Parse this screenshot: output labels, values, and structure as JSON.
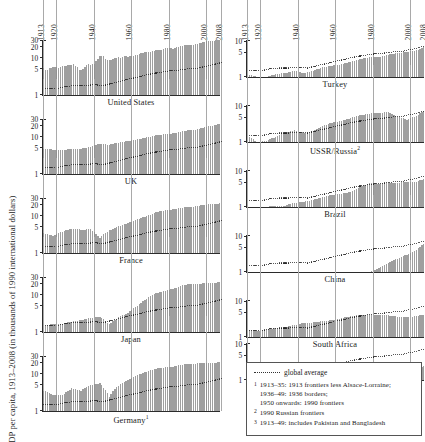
{
  "figure": {
    "ylabel": "GDP per capita, 1913–2008 (in thousands of 1990 international dollars)",
    "year_ticks": [
      "1913",
      "1920",
      "1940",
      "1960",
      "1980",
      "2000",
      "2008"
    ]
  },
  "legend": {
    "global_average_label": "global average",
    "footnotes": [
      {
        "num": "1",
        "lines": [
          "1913–35: 1913 frontiers less Alsace-Lorraine;",
          "1936–49: 1936 borders;",
          "1950 onwards: 1990 frontiers"
        ]
      },
      {
        "num": "2",
        "lines": [
          "1990 Russian frontiers"
        ]
      },
      {
        "num": "3",
        "lines": [
          "1913–49: includes Pakistan and Bangladesh"
        ]
      }
    ]
  },
  "chart_data": {
    "type": "bar",
    "title": "GDP per capita, 1913–2008",
    "ylabel": "GDP per capita, 1913–2008 (in thousands of 1990 international dollars)",
    "xlabel": "",
    "x_start": 1913,
    "x_end": 2008,
    "scale": "log",
    "grid": false,
    "legend_position": "bottom-right",
    "year_ticks": [
      1913,
      1920,
      1940,
      1960,
      1980,
      2000,
      2008
    ],
    "left_column_yticks": [
      1,
      5,
      10,
      20,
      30
    ],
    "right_column_yticks": [
      1,
      5,
      10
    ],
    "left_column_ylim": [
      1,
      33
    ],
    "right_column_ylim": [
      1,
      12
    ],
    "global_average_series": {
      "name": "global average",
      "style": "dotted",
      "years": [
        1913,
        1920,
        1925,
        1930,
        1935,
        1940,
        1945,
        1950,
        1955,
        1960,
        1965,
        1970,
        1975,
        1980,
        1985,
        1990,
        1995,
        2000,
        2005,
        2008
      ],
      "values": [
        1.5,
        1.5,
        1.7,
        1.8,
        1.8,
        1.9,
        1.8,
        2.1,
        2.4,
        2.8,
        3.2,
        3.7,
        4.1,
        4.5,
        4.7,
        5.1,
        5.3,
        6.0,
        6.9,
        7.6
      ]
    },
    "panels": [
      {
        "name": "United States",
        "footnote": "",
        "column": "left",
        "ylim": [
          1,
          33
        ],
        "yticks": [
          1,
          5,
          10,
          20,
          30
        ],
        "years": [
          1913,
          1914,
          1915,
          1916,
          1917,
          1918,
          1919,
          1920,
          1921,
          1922,
          1923,
          1924,
          1925,
          1926,
          1927,
          1928,
          1929,
          1930,
          1931,
          1932,
          1933,
          1934,
          1935,
          1936,
          1937,
          1938,
          1939,
          1940,
          1941,
          1942,
          1943,
          1944,
          1945,
          1946,
          1947,
          1948,
          1949,
          1950,
          1951,
          1952,
          1953,
          1954,
          1955,
          1956,
          1957,
          1958,
          1959,
          1960,
          1961,
          1962,
          1963,
          1964,
          1965,
          1966,
          1967,
          1968,
          1969,
          1970,
          1971,
          1972,
          1973,
          1974,
          1975,
          1976,
          1977,
          1978,
          1979,
          1980,
          1981,
          1982,
          1983,
          1984,
          1985,
          1986,
          1987,
          1988,
          1989,
          1990,
          1991,
          1992,
          1993,
          1994,
          1995,
          1996,
          1997,
          1998,
          1999,
          2000,
          2001,
          2002,
          2003,
          2004,
          2005,
          2006,
          2007,
          2008
        ],
        "values": [
          5.3,
          4.8,
          4.9,
          5.5,
          5.3,
          5.7,
          5.7,
          5.6,
          5.4,
          5.6,
          6.2,
          6.2,
          6.3,
          6.6,
          6.6,
          6.6,
          6.9,
          6.2,
          5.7,
          4.9,
          4.8,
          5.2,
          5.9,
          6.5,
          6.8,
          6.4,
          6.8,
          7.0,
          8.2,
          9.7,
          11.1,
          11.7,
          11.4,
          9.2,
          8.9,
          9.1,
          8.9,
          9.6,
          10.2,
          10.4,
          10.7,
          10.4,
          11.0,
          11.1,
          11.1,
          10.7,
          11.3,
          11.3,
          11.4,
          11.9,
          12.2,
          12.7,
          13.4,
          14.1,
          14.3,
          14.8,
          15.1,
          15.0,
          15.3,
          16.0,
          16.7,
          16.4,
          16.2,
          16.9,
          17.5,
          18.3,
          18.7,
          18.5,
          18.8,
          18.2,
          18.8,
          19.9,
          20.5,
          21.0,
          21.5,
          22.2,
          22.8,
          23.0,
          22.6,
          23.0,
          23.4,
          24.0,
          24.4,
          25.1,
          25.9,
          26.6,
          27.5,
          28.4,
          28.4,
          28.6,
          29.1,
          29.9,
          30.6,
          31.1,
          31.3,
          31.2
        ]
      },
      {
        "name": "UK",
        "footnote": "",
        "column": "left",
        "ylim": [
          1,
          33
        ],
        "yticks": [
          1,
          5,
          10,
          20,
          30
        ],
        "years": [
          1913,
          1918,
          1923,
          1928,
          1933,
          1938,
          1943,
          1948,
          1953,
          1958,
          1963,
          1968,
          1973,
          1978,
          1983,
          1988,
          1993,
          1998,
          2003,
          2008
        ],
        "values": [
          4.9,
          4.6,
          4.4,
          4.9,
          4.8,
          5.5,
          6.6,
          6.2,
          7.1,
          7.8,
          8.7,
          9.8,
          11.2,
          12.0,
          12.7,
          15.0,
          15.5,
          18.2,
          20.5,
          23.7
        ]
      },
      {
        "name": "France",
        "footnote": "",
        "column": "left",
        "ylim": [
          1,
          33
        ],
        "yticks": [
          1,
          5,
          10,
          20,
          30
        ],
        "years": [
          1913,
          1918,
          1923,
          1928,
          1933,
          1938,
          1943,
          1948,
          1953,
          1958,
          1963,
          1968,
          1973,
          1978,
          1983,
          1988,
          1993,
          1998,
          2003,
          2008
        ],
        "values": [
          3.5,
          2.9,
          3.8,
          4.6,
          4.3,
          4.4,
          2.6,
          4.1,
          5.3,
          6.4,
          8.2,
          9.9,
          12.8,
          14.4,
          15.4,
          17.4,
          18.0,
          20.0,
          21.5,
          22.2
        ]
      },
      {
        "name": "Japan",
        "footnote": "",
        "column": "left",
        "ylim": [
          1,
          33
        ],
        "yticks": [
          1,
          5,
          10,
          20,
          30
        ],
        "years": [
          1913,
          1918,
          1923,
          1928,
          1933,
          1938,
          1943,
          1948,
          1953,
          1958,
          1963,
          1968,
          1973,
          1978,
          1983,
          1988,
          1993,
          1998,
          2003,
          2008
        ],
        "values": [
          1.4,
          1.7,
          1.7,
          1.9,
          2.1,
          2.4,
          2.6,
          1.6,
          2.5,
          3.3,
          5.1,
          8.0,
          11.4,
          13.0,
          15.3,
          19.1,
          20.6,
          20.7,
          21.2,
          22.8
        ]
      },
      {
        "name": "Germany",
        "footnote": "1",
        "column": "left",
        "ylim": [
          1,
          33
        ],
        "yticks": [
          1,
          5,
          10,
          20,
          30
        ],
        "years": [
          1913,
          1918,
          1923,
          1928,
          1933,
          1938,
          1943,
          1948,
          1953,
          1958,
          1963,
          1968,
          1973,
          1978,
          1983,
          1988,
          1993,
          1998,
          2003,
          2008
        ],
        "values": [
          3.6,
          2.8,
          2.7,
          4.1,
          3.6,
          5.1,
          5.6,
          2.4,
          4.9,
          7.1,
          9.6,
          11.6,
          14.0,
          15.4,
          16.2,
          18.7,
          19.3,
          19.8,
          19.9,
          21.3
        ]
      },
      {
        "name": "Turkey",
        "footnote": "",
        "column": "right",
        "ylim": [
          1,
          12
        ],
        "yticks": [
          1,
          5,
          10
        ],
        "years": [
          1913,
          1918,
          1923,
          1928,
          1933,
          1938,
          1943,
          1948,
          1953,
          1958,
          1963,
          1968,
          1973,
          1978,
          1983,
          1988,
          1993,
          1998,
          2003,
          2008
        ],
        "values": [
          1.2,
          1.0,
          1.0,
          1.2,
          1.3,
          1.5,
          1.3,
          1.5,
          1.9,
          2.1,
          2.3,
          2.7,
          3.2,
          3.6,
          3.7,
          4.3,
          4.8,
          5.2,
          5.7,
          7.2
        ]
      },
      {
        "name": "USSR/Russia",
        "footnote": "2",
        "column": "right",
        "ylim": [
          1,
          12
        ],
        "yticks": [
          1,
          5,
          10
        ],
        "years": [
          1913,
          1918,
          1923,
          1928,
          1933,
          1938,
          1943,
          1948,
          1953,
          1958,
          1963,
          1968,
          1973,
          1978,
          1983,
          1988,
          1993,
          1998,
          2003,
          2008
        ],
        "values": [
          1.5,
          1.0,
          1.1,
          1.4,
          1.8,
          2.2,
          1.8,
          2.1,
          2.9,
          3.5,
          4.0,
          4.8,
          5.8,
          6.4,
          6.7,
          7.1,
          5.3,
          4.3,
          5.5,
          7.9
        ]
      },
      {
        "name": "Brazil",
        "footnote": "",
        "column": "right",
        "ylim": [
          1,
          12
        ],
        "yticks": [
          1,
          5,
          10
        ],
        "years": [
          1913,
          1918,
          1923,
          1928,
          1933,
          1938,
          1943,
          1948,
          1953,
          1958,
          1963,
          1968,
          1973,
          1978,
          1983,
          1988,
          1993,
          1998,
          2003,
          2008
        ],
        "values": [
          0.8,
          0.9,
          1.0,
          1.1,
          1.1,
          1.3,
          1.4,
          1.6,
          1.9,
          2.2,
          2.4,
          2.7,
          3.7,
          4.7,
          4.5,
          4.9,
          4.9,
          5.2,
          5.3,
          6.4
        ]
      },
      {
        "name": "China",
        "footnote": "",
        "column": "right",
        "ylim": [
          1,
          12
        ],
        "yticks": [
          1,
          5,
          10
        ],
        "years": [
          1913,
          1918,
          1923,
          1928,
          1933,
          1938,
          1943,
          1948,
          1953,
          1958,
          1963,
          1968,
          1973,
          1978,
          1983,
          1988,
          1993,
          1998,
          2003,
          2008
        ],
        "values": [
          0.55,
          0.55,
          0.6,
          0.6,
          0.6,
          0.56,
          0.5,
          0.44,
          0.6,
          0.68,
          0.67,
          0.8,
          0.84,
          0.98,
          1.3,
          1.8,
          2.4,
          3.1,
          4.3,
          6.7
        ]
      },
      {
        "name": "South Africa",
        "footnote": "",
        "column": "right",
        "ylim": [
          1,
          12
        ],
        "yticks": [
          1,
          5,
          10
        ],
        "years": [
          1913,
          1918,
          1923,
          1928,
          1933,
          1938,
          1943,
          1948,
          1953,
          1958,
          1963,
          1968,
          1973,
          1978,
          1983,
          1988,
          1993,
          1998,
          2003,
          2008
        ],
        "values": [
          1.6,
          1.5,
          1.6,
          1.8,
          1.9,
          2.2,
          2.5,
          2.6,
          2.8,
          3.0,
          3.4,
          3.9,
          4.3,
          4.2,
          4.3,
          4.1,
          3.8,
          3.7,
          3.9,
          4.4
        ]
      },
      {
        "name": "India",
        "footnote": "3",
        "column": "right",
        "ylim": [
          1,
          12
        ],
        "yticks": [
          1,
          5,
          10
        ],
        "years": [
          1913,
          1918,
          1923,
          1928,
          1933,
          1938,
          1943,
          1948,
          1953,
          1958,
          1963,
          1968,
          1973,
          1978,
          1983,
          1988,
          1993,
          1998,
          2003,
          2008
        ],
        "values": [
          0.67,
          0.63,
          0.67,
          0.71,
          0.7,
          0.68,
          0.62,
          0.62,
          0.68,
          0.73,
          0.8,
          0.84,
          0.86,
          0.97,
          1.05,
          1.25,
          1.4,
          1.7,
          2.0,
          2.6
        ]
      }
    ]
  }
}
